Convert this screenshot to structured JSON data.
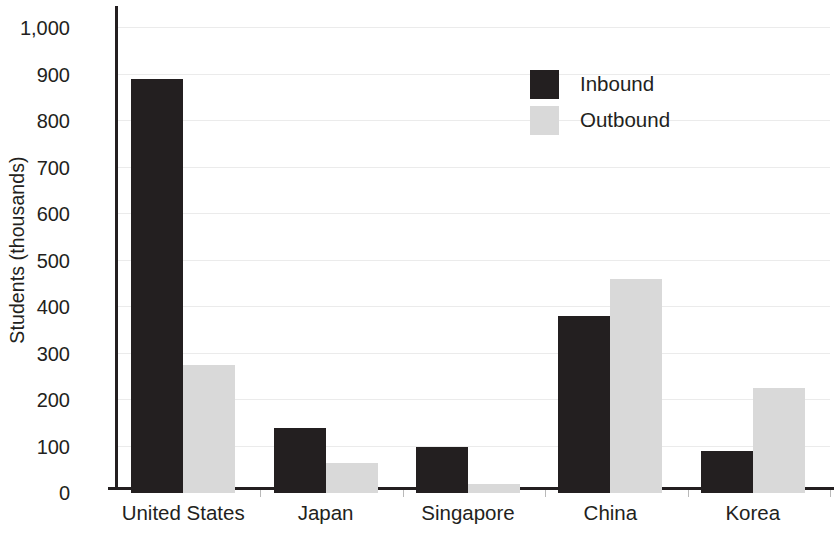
{
  "chart_data": {
    "type": "bar",
    "title": "",
    "subtitle": "",
    "xlabel": "",
    "ylabel": "Students (thousands)",
    "categories": [
      "United States",
      "Japan",
      "Singapore",
      "China",
      "Korea"
    ],
    "series": [
      {
        "name": "Inbound",
        "color": "#231f20",
        "values": [
          890,
          140,
          100,
          380,
          90
        ]
      },
      {
        "name": "Outbound",
        "color": "#d9d9d9",
        "values": [
          275,
          65,
          20,
          460,
          225
        ]
      }
    ],
    "ylim": [
      0,
      1000
    ],
    "ytick_values": [
      0,
      100,
      200,
      300,
      400,
      500,
      600,
      700,
      800,
      900,
      1000
    ],
    "ytick_labels": [
      "0",
      "100",
      "200",
      "300",
      "400",
      "500",
      "600",
      "700",
      "800",
      "900",
      "1,000"
    ],
    "grid": true,
    "grid_axis": "y",
    "grid_color": "#ebebeb",
    "legend": {
      "position": "upper-center-right",
      "entries": [
        {
          "label": "Inbound",
          "color": "#231f20"
        },
        {
          "label": "Outbound",
          "color": "#d9d9d9"
        }
      ]
    },
    "axis_color": "#231f20",
    "background": "#ffffff"
  }
}
